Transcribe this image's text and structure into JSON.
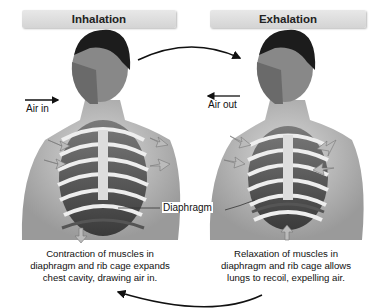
{
  "headers": {
    "left": "Inhalation",
    "right": "Exhalation"
  },
  "labels": {
    "air_in": "Air in",
    "air_out": "Air out",
    "diaphragm": "Diaphragm"
  },
  "captions": {
    "left": [
      "Contraction of muscles in",
      "diaphragm and rib cage expands",
      "chest cavity, drawing air in."
    ],
    "right": [
      "Relaxation of muscles in",
      "diaphragm and rib cage allows",
      "lungs to recoil, expelling air."
    ]
  }
}
